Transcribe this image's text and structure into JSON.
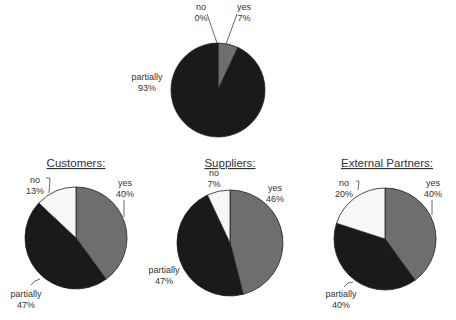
{
  "chart_data": [
    {
      "type": "pie",
      "title": "",
      "slices": [
        {
          "label": "yes",
          "value": 7,
          "display": "7%",
          "color": "#6e6e6e"
        },
        {
          "label": "partially",
          "value": 93,
          "display": "93%",
          "color": "#1a1a1a"
        },
        {
          "label": "no",
          "value": 0,
          "display": "0%",
          "color": "#f7f7f7"
        }
      ]
    },
    {
      "type": "pie",
      "title": "Customers:",
      "slices": [
        {
          "label": "yes",
          "value": 40,
          "display": "40%",
          "color": "#6e6e6e"
        },
        {
          "label": "partially",
          "value": 47,
          "display": "47%",
          "color": "#1a1a1a"
        },
        {
          "label": "no",
          "value": 13,
          "display": "13%",
          "color": "#f7f7f7"
        }
      ]
    },
    {
      "type": "pie",
      "title": "Suppliers:",
      "slices": [
        {
          "label": "yes",
          "value": 46,
          "display": "46%",
          "color": "#6e6e6e"
        },
        {
          "label": "partially",
          "value": 47,
          "display": "47%",
          "color": "#1a1a1a"
        },
        {
          "label": "no",
          "value": 7,
          "display": "7%",
          "color": "#f7f7f7"
        }
      ]
    },
    {
      "type": "pie",
      "title": "External Partners:",
      "slices": [
        {
          "label": "yes",
          "value": 40,
          "display": "40%",
          "color": "#6e6e6e"
        },
        {
          "label": "partially",
          "value": 40,
          "display": "40%",
          "color": "#1a1a1a"
        },
        {
          "label": "no",
          "value": 20,
          "display": "20%",
          "color": "#f7f7f7"
        }
      ]
    }
  ]
}
